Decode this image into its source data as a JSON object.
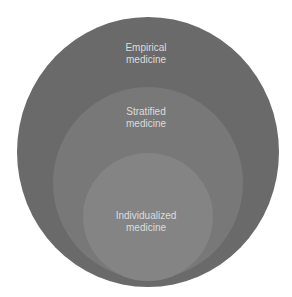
{
  "diagram": {
    "type": "nested-circles",
    "circles": [
      {
        "id": "outer",
        "line1": "Empirical",
        "line2": "medicine",
        "color": "#6a6a6a"
      },
      {
        "id": "middle",
        "line1": "Stratified",
        "line2": "medicine",
        "color": "#787878"
      },
      {
        "id": "inner",
        "line1": "Individualized",
        "line2": "medicine",
        "color": "#848484"
      }
    ],
    "text_color": "#dcdcdc"
  }
}
